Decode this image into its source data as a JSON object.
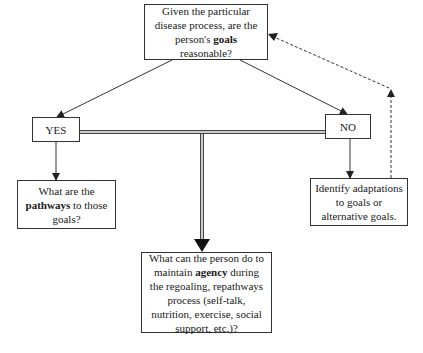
{
  "diagram": {
    "type": "flowchart",
    "nodes": {
      "main": {
        "text_before": "Given the particular disease process, are the person's ",
        "bold": "goals",
        "text_after": " reasonable?"
      },
      "yes": {
        "label": "YES"
      },
      "no": {
        "label": "NO"
      },
      "left": {
        "text_before": "What are the ",
        "bold": "pathways",
        "text_after": " to those goals?"
      },
      "right": {
        "text": "Identify adaptations to goals or alternative goals."
      },
      "bottom": {
        "text_before": "What can the person do to maintain ",
        "bold": "agency",
        "text_after": " during the regoaling, repathways process (self-talk, nutrition, exercise, social support, etc.)?"
      }
    },
    "edges": [
      {
        "from": "main",
        "to": "yes",
        "style": "solid"
      },
      {
        "from": "main",
        "to": "no",
        "style": "solid"
      },
      {
        "from": "yes",
        "to": "left",
        "style": "solid"
      },
      {
        "from": "no",
        "to": "right",
        "style": "solid"
      },
      {
        "from": "yes-no-connector",
        "to": "bottom",
        "style": "double"
      },
      {
        "from": "right",
        "to": "main",
        "style": "dashed"
      }
    ],
    "colors": {
      "line": "#333333",
      "background": "#ffffff",
      "text": "#1a1a1a"
    }
  }
}
